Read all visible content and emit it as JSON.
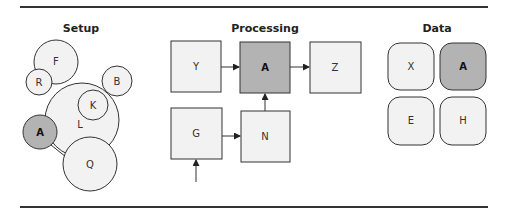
{
  "colors": {
    "node_fill": "#f2f2f2",
    "highlight_fill": "#b3b3b3",
    "stroke": "#333333",
    "rule": "#333333"
  },
  "panels": {
    "setup": {
      "title": "Setup",
      "circles": [
        {
          "id": "F",
          "label": "F",
          "cx": 56,
          "cy": 62,
          "r": 22,
          "highlight": false
        },
        {
          "id": "R",
          "label": "R",
          "cx": 39,
          "cy": 82,
          "r": 13,
          "highlight": false
        },
        {
          "id": "B",
          "label": "B",
          "cx": 117,
          "cy": 81,
          "r": 15,
          "highlight": false
        },
        {
          "id": "L",
          "label": "L",
          "cx": 82,
          "cy": 130,
          "r": 36,
          "highlight": false
        },
        {
          "id": "K",
          "label": "K",
          "cx": 93,
          "cy": 106,
          "r": 15,
          "highlight": false
        },
        {
          "id": "A",
          "label": "A",
          "cx": 40,
          "cy": 132,
          "r": 17,
          "highlight": true
        },
        {
          "id": "Q",
          "label": "Q",
          "cx": 90,
          "cy": 165,
          "r": 27,
          "highlight": false
        }
      ]
    },
    "processing": {
      "title": "Processing",
      "boxes": [
        {
          "id": "Y",
          "label": "Y",
          "x": 171,
          "y": 41,
          "w": 50,
          "h": 51,
          "highlight": false
        },
        {
          "id": "A",
          "label": "A",
          "x": 240,
          "y": 42,
          "w": 50,
          "h": 51,
          "highlight": true
        },
        {
          "id": "Z",
          "label": "Z",
          "x": 310,
          "y": 42,
          "w": 51,
          "h": 51,
          "highlight": false
        },
        {
          "id": "G",
          "label": "G",
          "x": 171,
          "y": 108,
          "w": 51,
          "h": 51,
          "highlight": false
        },
        {
          "id": "N",
          "label": "N",
          "x": 241,
          "y": 111,
          "w": 49,
          "h": 51,
          "highlight": false
        }
      ],
      "edges": [
        {
          "from": "Y",
          "to": "A"
        },
        {
          "from": "A",
          "to": "Z"
        },
        {
          "from": "G",
          "to": "N"
        },
        {
          "from": "N",
          "to": "A"
        },
        {
          "from": "external",
          "to": "G"
        }
      ]
    },
    "data": {
      "title": "Data",
      "tiles": [
        {
          "id": "X",
          "label": "X",
          "x": 388,
          "y": 43,
          "w": 46,
          "h": 47,
          "highlight": false
        },
        {
          "id": "A",
          "label": "A",
          "x": 440,
          "y": 43,
          "w": 46,
          "h": 47,
          "highlight": true
        },
        {
          "id": "E",
          "label": "E",
          "x": 388,
          "y": 97,
          "w": 46,
          "h": 48,
          "highlight": false
        },
        {
          "id": "H",
          "label": "H",
          "x": 440,
          "y": 97,
          "w": 46,
          "h": 48,
          "highlight": false
        }
      ]
    }
  }
}
